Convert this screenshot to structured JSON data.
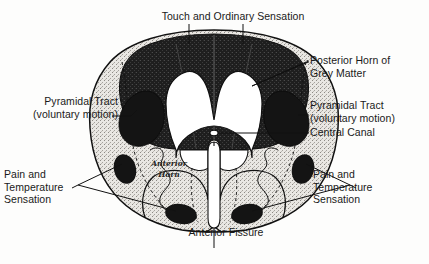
{
  "figure": {
    "background_color": "#fdfdfc",
    "ink_color": "#111111",
    "dark_fill_color": "#1c1c1c",
    "stipple_fill_color": "#cfcdc9",
    "white_fill_color": "#ffffff"
  },
  "labels": {
    "touch": "Touch and Ordinary Sensation",
    "posterior_horn": "Posterior Horn of\nGrey Matter",
    "pyramidal_right": "Pyramidal Tract\n(voluntary motion)",
    "central_canal": "Central Canal",
    "pain_right": "Pain and\nTemperature\nSensation",
    "pyramidal_left": "Pyramidal Tract\n(voluntary motion)",
    "pain_left": "Pain and\nTemperature\nSensation",
    "anterior_fissure": "Anterior Fissure",
    "anterior_horn": "Anterior\nHorn"
  }
}
